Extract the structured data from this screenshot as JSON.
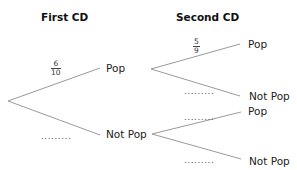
{
  "headings": {
    "first": "First CD",
    "second": "Second CD"
  },
  "first_cd": {
    "pop": {
      "label": "Pop",
      "probability": {
        "numerator": "6",
        "denominator": "10"
      }
    },
    "not_pop": {
      "label": "Not Pop",
      "probability_placeholder": "........."
    }
  },
  "second_cd": {
    "after_pop": {
      "pop": {
        "label": "Pop",
        "probability": {
          "numerator": "5",
          "denominator": "9"
        }
      },
      "not_pop": {
        "label": "Not Pop",
        "probability_placeholder": "........."
      }
    },
    "after_not_pop": {
      "pop": {
        "label": "Pop",
        "probability_placeholder": "........."
      },
      "not_pop": {
        "label": "Not Pop",
        "probability_placeholder": "........."
      }
    }
  },
  "colors": {
    "branch": "#9a9a9a",
    "text": "#222222"
  }
}
